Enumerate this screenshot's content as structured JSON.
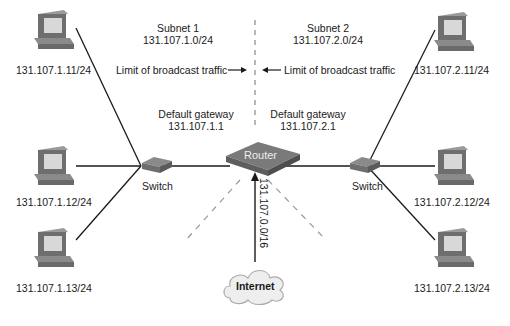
{
  "subnet1": {
    "title": "Subnet 1",
    "network": "131.107.1.0/24",
    "broadcast_label": "Limit of broadcast traffic",
    "gateway_label": "Default gateway",
    "gateway_ip": "131.107.1.1",
    "switch_label": "Switch",
    "hosts": [
      {
        "ip": "131.107.1.11/24"
      },
      {
        "ip": "131.107.1.12/24"
      },
      {
        "ip": "131.107.1.13/24"
      }
    ]
  },
  "subnet2": {
    "title": "Subnet 2",
    "network": "131.107.2.0/24",
    "broadcast_label": "Limit of broadcast traffic",
    "gateway_label": "Default gateway",
    "gateway_ip": "131.107.2.1",
    "switch_label": "Switch",
    "hosts": [
      {
        "ip": "131.107.2.11/24"
      },
      {
        "ip": "131.107.2.12/24"
      },
      {
        "ip": "131.107.2.13/24"
      }
    ]
  },
  "router": {
    "label": "Router"
  },
  "uplink": {
    "network": "131.107.0.0/16"
  },
  "internet": {
    "label": "Internet"
  },
  "colors": {
    "line": "#1a1a1a",
    "dash": "#888888",
    "device": "#6e6e6e",
    "screen": "#d8d8d8"
  }
}
